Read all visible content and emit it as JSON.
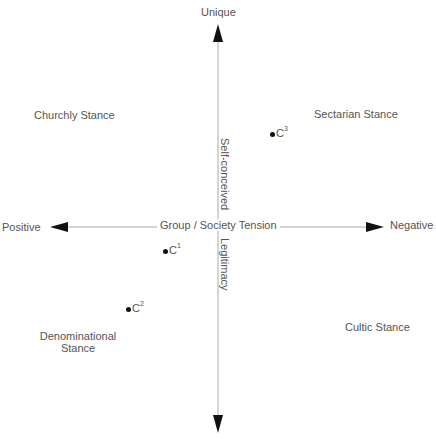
{
  "axes": {
    "vertical": {
      "top_label": "Unique",
      "bottom_label": "",
      "upper_caption": "Self-conceived",
      "lower_caption": "Legitimacy"
    },
    "horizontal": {
      "left_label": "Positive",
      "right_label": "Negative",
      "caption": "Group / Society Tension"
    }
  },
  "quadrants": {
    "top_left": "Churchly Stance",
    "top_right": "Sectarian Stance",
    "bottom_left_line1": "Denominational",
    "bottom_left_line2": "Stance",
    "bottom_right": "Cultic Stance"
  },
  "points": [
    {
      "label": "C",
      "sup": "1"
    },
    {
      "label": "C",
      "sup": "2"
    },
    {
      "label": "C",
      "sup": "3"
    }
  ],
  "colors": {
    "axis_line": "#999999",
    "arrow": "#111111",
    "text": "#555555"
  }
}
